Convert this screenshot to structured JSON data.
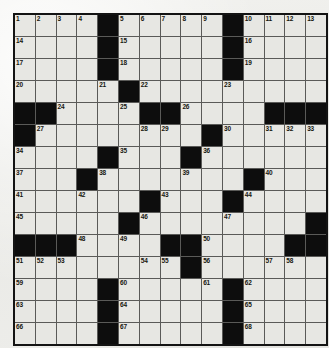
{
  "puzzle": {
    "title": "Crossword Grid",
    "columns": 15,
    "rows": 15,
    "colors": {
      "page_background": "#eeeeec",
      "white_cell": "#e7e7e3",
      "black_cell": "#0d0d0d",
      "grid_line": "#5a5a58",
      "outer_border": "#131313",
      "number_text": "#16160f"
    },
    "grid": [
      [
        {
          "type": "white",
          "number": "1"
        },
        {
          "type": "white",
          "number": "2"
        },
        {
          "type": "white",
          "number": "3"
        },
        {
          "type": "white",
          "number": "4"
        },
        {
          "type": "black",
          "number": ""
        },
        {
          "type": "white",
          "number": "5"
        },
        {
          "type": "white",
          "number": "6"
        },
        {
          "type": "white",
          "number": "7"
        },
        {
          "type": "white",
          "number": "8"
        },
        {
          "type": "white",
          "number": "9"
        },
        {
          "type": "black",
          "number": ""
        },
        {
          "type": "white",
          "number": "10"
        },
        {
          "type": "white",
          "number": "11"
        },
        {
          "type": "white",
          "number": "12"
        },
        {
          "type": "white",
          "number": "13"
        }
      ],
      [
        {
          "type": "white",
          "number": "14"
        },
        {
          "type": "white",
          "number": ""
        },
        {
          "type": "white",
          "number": ""
        },
        {
          "type": "white",
          "number": ""
        },
        {
          "type": "black",
          "number": ""
        },
        {
          "type": "white",
          "number": "15"
        },
        {
          "type": "white",
          "number": ""
        },
        {
          "type": "white",
          "number": ""
        },
        {
          "type": "white",
          "number": ""
        },
        {
          "type": "white",
          "number": ""
        },
        {
          "type": "black",
          "number": ""
        },
        {
          "type": "white",
          "number": "16"
        },
        {
          "type": "white",
          "number": ""
        },
        {
          "type": "white",
          "number": ""
        },
        {
          "type": "white",
          "number": ""
        }
      ],
      [
        {
          "type": "white",
          "number": "17"
        },
        {
          "type": "white",
          "number": ""
        },
        {
          "type": "white",
          "number": ""
        },
        {
          "type": "white",
          "number": ""
        },
        {
          "type": "black",
          "number": ""
        },
        {
          "type": "white",
          "number": "18"
        },
        {
          "type": "white",
          "number": ""
        },
        {
          "type": "white",
          "number": ""
        },
        {
          "type": "white",
          "number": ""
        },
        {
          "type": "white",
          "number": ""
        },
        {
          "type": "black",
          "number": ""
        },
        {
          "type": "white",
          "number": "19"
        },
        {
          "type": "white",
          "number": ""
        },
        {
          "type": "white",
          "number": ""
        },
        {
          "type": "white",
          "number": ""
        }
      ],
      [
        {
          "type": "white",
          "number": "20"
        },
        {
          "type": "white",
          "number": ""
        },
        {
          "type": "white",
          "number": ""
        },
        {
          "type": "white",
          "number": ""
        },
        {
          "type": "white",
          "number": "21"
        },
        {
          "type": "black",
          "number": ""
        },
        {
          "type": "white",
          "number": "22"
        },
        {
          "type": "white",
          "number": ""
        },
        {
          "type": "white",
          "number": ""
        },
        {
          "type": "white",
          "number": ""
        },
        {
          "type": "white",
          "number": "23"
        },
        {
          "type": "white",
          "number": ""
        },
        {
          "type": "white",
          "number": ""
        },
        {
          "type": "white",
          "number": ""
        },
        {
          "type": "white",
          "number": ""
        }
      ],
      [
        {
          "type": "black",
          "number": ""
        },
        {
          "type": "black",
          "number": ""
        },
        {
          "type": "white",
          "number": "24"
        },
        {
          "type": "white",
          "number": ""
        },
        {
          "type": "white",
          "number": ""
        },
        {
          "type": "white",
          "number": "25"
        },
        {
          "type": "black",
          "number": ""
        },
        {
          "type": "black",
          "number": ""
        },
        {
          "type": "white",
          "number": "26"
        },
        {
          "type": "white",
          "number": ""
        },
        {
          "type": "white",
          "number": ""
        },
        {
          "type": "white",
          "number": ""
        },
        {
          "type": "black",
          "number": ""
        },
        {
          "type": "black",
          "number": ""
        },
        {
          "type": "black",
          "number": ""
        }
      ],
      [
        {
          "type": "black",
          "number": ""
        },
        {
          "type": "white",
          "number": "27"
        },
        {
          "type": "white",
          "number": ""
        },
        {
          "type": "white",
          "number": ""
        },
        {
          "type": "white",
          "number": ""
        },
        {
          "type": "white",
          "number": ""
        },
        {
          "type": "white",
          "number": "28"
        },
        {
          "type": "white",
          "number": "29"
        },
        {
          "type": "white",
          "number": ""
        },
        {
          "type": "black",
          "number": ""
        },
        {
          "type": "white",
          "number": "30"
        },
        {
          "type": "white",
          "number": ""
        },
        {
          "type": "white",
          "number": "31"
        },
        {
          "type": "white",
          "number": "32"
        },
        {
          "type": "white",
          "number": "33"
        }
      ],
      [
        {
          "type": "white",
          "number": "34"
        },
        {
          "type": "white",
          "number": ""
        },
        {
          "type": "white",
          "number": ""
        },
        {
          "type": "white",
          "number": ""
        },
        {
          "type": "black",
          "number": ""
        },
        {
          "type": "white",
          "number": "35"
        },
        {
          "type": "white",
          "number": ""
        },
        {
          "type": "white",
          "number": ""
        },
        {
          "type": "black",
          "number": ""
        },
        {
          "type": "white",
          "number": "36"
        },
        {
          "type": "white",
          "number": ""
        },
        {
          "type": "white",
          "number": ""
        },
        {
          "type": "white",
          "number": ""
        },
        {
          "type": "white",
          "number": ""
        },
        {
          "type": "white",
          "number": ""
        }
      ],
      [
        {
          "type": "white",
          "number": "37"
        },
        {
          "type": "white",
          "number": ""
        },
        {
          "type": "white",
          "number": ""
        },
        {
          "type": "black",
          "number": ""
        },
        {
          "type": "white",
          "number": "38"
        },
        {
          "type": "white",
          "number": ""
        },
        {
          "type": "white",
          "number": ""
        },
        {
          "type": "white",
          "number": ""
        },
        {
          "type": "white",
          "number": "39"
        },
        {
          "type": "white",
          "number": ""
        },
        {
          "type": "white",
          "number": ""
        },
        {
          "type": "black",
          "number": ""
        },
        {
          "type": "white",
          "number": "40"
        },
        {
          "type": "white",
          "number": ""
        },
        {
          "type": "white",
          "number": ""
        }
      ],
      [
        {
          "type": "white",
          "number": "41"
        },
        {
          "type": "white",
          "number": ""
        },
        {
          "type": "white",
          "number": ""
        },
        {
          "type": "white",
          "number": "42"
        },
        {
          "type": "white",
          "number": ""
        },
        {
          "type": "white",
          "number": ""
        },
        {
          "type": "black",
          "number": ""
        },
        {
          "type": "white",
          "number": "43"
        },
        {
          "type": "white",
          "number": ""
        },
        {
          "type": "white",
          "number": ""
        },
        {
          "type": "black",
          "number": ""
        },
        {
          "type": "white",
          "number": "44"
        },
        {
          "type": "white",
          "number": ""
        },
        {
          "type": "white",
          "number": ""
        },
        {
          "type": "white",
          "number": ""
        }
      ],
      [
        {
          "type": "white",
          "number": "45"
        },
        {
          "type": "white",
          "number": ""
        },
        {
          "type": "white",
          "number": ""
        },
        {
          "type": "white",
          "number": ""
        },
        {
          "type": "white",
          "number": ""
        },
        {
          "type": "black",
          "number": ""
        },
        {
          "type": "white",
          "number": "46"
        },
        {
          "type": "white",
          "number": ""
        },
        {
          "type": "white",
          "number": ""
        },
        {
          "type": "white",
          "number": ""
        },
        {
          "type": "white",
          "number": "47"
        },
        {
          "type": "white",
          "number": ""
        },
        {
          "type": "white",
          "number": ""
        },
        {
          "type": "white",
          "number": ""
        },
        {
          "type": "black",
          "number": ""
        }
      ],
      [
        {
          "type": "black",
          "number": ""
        },
        {
          "type": "black",
          "number": ""
        },
        {
          "type": "black",
          "number": ""
        },
        {
          "type": "white",
          "number": "48"
        },
        {
          "type": "white",
          "number": ""
        },
        {
          "type": "white",
          "number": "49"
        },
        {
          "type": "white",
          "number": ""
        },
        {
          "type": "black",
          "number": ""
        },
        {
          "type": "black",
          "number": ""
        },
        {
          "type": "white",
          "number": "50"
        },
        {
          "type": "white",
          "number": ""
        },
        {
          "type": "white",
          "number": ""
        },
        {
          "type": "white",
          "number": ""
        },
        {
          "type": "black",
          "number": ""
        },
        {
          "type": "black",
          "number": ""
        }
      ],
      [
        {
          "type": "white",
          "number": "51"
        },
        {
          "type": "white",
          "number": "52"
        },
        {
          "type": "white",
          "number": "53"
        },
        {
          "type": "white",
          "number": ""
        },
        {
          "type": "white",
          "number": ""
        },
        {
          "type": "white",
          "number": ""
        },
        {
          "type": "white",
          "number": "54"
        },
        {
          "type": "white",
          "number": "55"
        },
        {
          "type": "black",
          "number": ""
        },
        {
          "type": "white",
          "number": "56"
        },
        {
          "type": "white",
          "number": ""
        },
        {
          "type": "white",
          "number": ""
        },
        {
          "type": "white",
          "number": "57"
        },
        {
          "type": "white",
          "number": "58"
        },
        {
          "type": "white",
          "number": ""
        }
      ],
      [
        {
          "type": "white",
          "number": "59"
        },
        {
          "type": "white",
          "number": ""
        },
        {
          "type": "white",
          "number": ""
        },
        {
          "type": "white",
          "number": ""
        },
        {
          "type": "black",
          "number": ""
        },
        {
          "type": "white",
          "number": "60"
        },
        {
          "type": "white",
          "number": ""
        },
        {
          "type": "white",
          "number": ""
        },
        {
          "type": "white",
          "number": ""
        },
        {
          "type": "white",
          "number": "61"
        },
        {
          "type": "black",
          "number": ""
        },
        {
          "type": "white",
          "number": "62"
        },
        {
          "type": "white",
          "number": ""
        },
        {
          "type": "white",
          "number": ""
        },
        {
          "type": "white",
          "number": ""
        }
      ],
      [
        {
          "type": "white",
          "number": "63"
        },
        {
          "type": "white",
          "number": ""
        },
        {
          "type": "white",
          "number": ""
        },
        {
          "type": "white",
          "number": ""
        },
        {
          "type": "black",
          "number": ""
        },
        {
          "type": "white",
          "number": "64"
        },
        {
          "type": "white",
          "number": ""
        },
        {
          "type": "white",
          "number": ""
        },
        {
          "type": "white",
          "number": ""
        },
        {
          "type": "white",
          "number": ""
        },
        {
          "type": "black",
          "number": ""
        },
        {
          "type": "white",
          "number": "65"
        },
        {
          "type": "white",
          "number": ""
        },
        {
          "type": "white",
          "number": ""
        },
        {
          "type": "white",
          "number": ""
        }
      ],
      [
        {
          "type": "white",
          "number": "66"
        },
        {
          "type": "white",
          "number": ""
        },
        {
          "type": "white",
          "number": ""
        },
        {
          "type": "white",
          "number": ""
        },
        {
          "type": "black",
          "number": ""
        },
        {
          "type": "white",
          "number": "67"
        },
        {
          "type": "white",
          "number": ""
        },
        {
          "type": "white",
          "number": ""
        },
        {
          "type": "white",
          "number": ""
        },
        {
          "type": "white",
          "number": ""
        },
        {
          "type": "black",
          "number": ""
        },
        {
          "type": "white",
          "number": "68"
        },
        {
          "type": "white",
          "number": ""
        },
        {
          "type": "white",
          "number": ""
        },
        {
          "type": "white",
          "number": ""
        }
      ]
    ]
  }
}
